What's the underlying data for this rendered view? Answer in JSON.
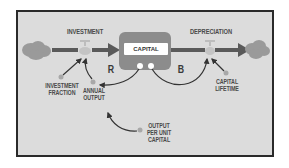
{
  "diagram": {
    "type": "stock-and-flow",
    "stock": {
      "label": "CAPITAL"
    },
    "flows": [
      {
        "label": "INVESTMENT",
        "direction": "inflow"
      },
      {
        "label": "DEPRECIATION",
        "direction": "outflow"
      }
    ],
    "auxiliaries": [
      {
        "label": "INVESTMENT\nFRACTION"
      },
      {
        "label": "ANNUAL\nOUTPUT"
      },
      {
        "label": "CAPITAL\nLIFETIME"
      },
      {
        "label": "OUTPUT\nPER UNIT\nCAPITAL"
      }
    ],
    "loops": [
      {
        "label": "R",
        "polarity": "reinforcing"
      },
      {
        "label": "B",
        "polarity": "balancing"
      }
    ],
    "colors": {
      "background": "#dcdcdc",
      "frame": "#2a2a2a",
      "stock": "#8c8c8c",
      "cloud": "#9a9a9a",
      "pipe": "#5a5a5a",
      "link": "#333333",
      "aux_dot": "#a8a8a8"
    }
  }
}
